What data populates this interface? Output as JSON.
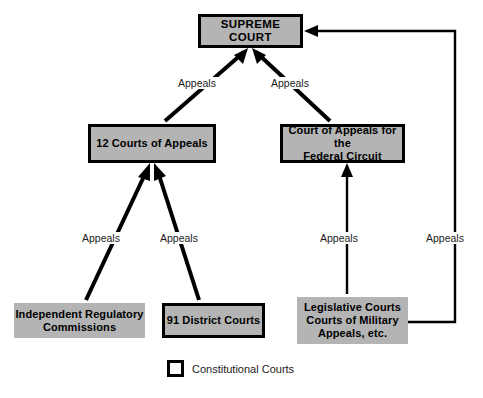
{
  "diagram": {
    "colors": {
      "box_fill": "#b4b4b4",
      "box_border": "#000000",
      "line": "#000000",
      "background": "#ffffff",
      "text": "#000000"
    },
    "nodes": {
      "supreme_court": {
        "label": "SUPREME COURT",
        "kind": "constitutional"
      },
      "courts_of_appeals": {
        "label": "12 Courts of Appeals",
        "kind": "constitutional"
      },
      "federal_circuit": {
        "line1": "Court of Appeals for the",
        "line2": "Federal Circuit",
        "kind": "constitutional"
      },
      "district_courts": {
        "label": "91 District Courts",
        "kind": "constitutional"
      },
      "regulatory_commissions": {
        "line1": "Independent Regulatory",
        "line2": "Commissions",
        "kind": "other"
      },
      "legislative_courts": {
        "line1": "Legislative Courts",
        "line2": "Courts of Military",
        "line3": "Appeals, etc.",
        "kind": "other"
      }
    },
    "edges": [
      {
        "id": "coa-to-supreme",
        "label": "Appeals",
        "from": "courts_of_appeals",
        "to": "supreme_court",
        "weight": "thick"
      },
      {
        "id": "fedcirc-to-supreme",
        "label": "Appeals",
        "from": "federal_circuit",
        "to": "supreme_court",
        "weight": "thick"
      },
      {
        "id": "commissions-to-coa",
        "label": "Appeals",
        "from": "regulatory_commissions",
        "to": "courts_of_appeals",
        "weight": "thick"
      },
      {
        "id": "district-to-coa",
        "label": "Appeals",
        "from": "district_courts",
        "to": "courts_of_appeals",
        "weight": "thick"
      },
      {
        "id": "legislative-to-fedcirc",
        "label": "Appeals",
        "from": "legislative_courts",
        "to": "federal_circuit",
        "weight": "thin"
      },
      {
        "id": "legislative-to-supreme",
        "label": "Appeals",
        "from": "legislative_courts",
        "to": "supreme_court",
        "weight": "thin"
      }
    ],
    "legend": {
      "swatch": "white-square-black-border",
      "label": "Constitutional Courts"
    }
  }
}
